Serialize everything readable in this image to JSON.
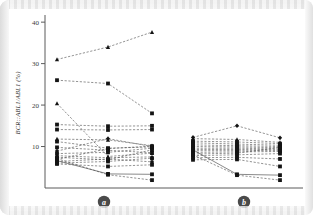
{
  "figure": {
    "name": "bcr-abl1-spaghetti-plot",
    "background": "#ffffff",
    "line_color": "#4a4a4a",
    "marker_color": "#141414",
    "axis_color": "#5b5b5b"
  },
  "axis": {
    "y_label": "BCR::ABL1/ABL1 (%)",
    "y_ticks": [
      10,
      20,
      30,
      40
    ],
    "y_tick_labels": [
      "10",
      "20",
      "30",
      "40"
    ],
    "y_min": 0,
    "y_max": 41
  },
  "groups": [
    {
      "id": "a",
      "label": "a"
    },
    {
      "id": "b",
      "label": "b"
    }
  ],
  "chart_data": {
    "type": "line",
    "title": "",
    "xlabel": "",
    "ylabel": "BCR::ABL1/ABL1 (%)",
    "ylim": [
      0,
      41
    ],
    "grid": false,
    "legend": "none",
    "x_tick_labels": [
      "a",
      "b"
    ],
    "panels": [
      {
        "name": "a",
        "x_positions": [
          1,
          2,
          3
        ],
        "series": [
          {
            "name": "a1",
            "marker": "triangle",
            "style": "dashed",
            "values": [
              31.0,
              34.0,
              37.6
            ]
          },
          {
            "name": "a2",
            "marker": "square",
            "style": "dashed",
            "values": [
              26.0,
              25.2,
              18.0
            ]
          },
          {
            "name": "a3",
            "marker": "triangle",
            "style": "dashed",
            "values": [
              20.4,
              7.6,
              8.4
            ]
          },
          {
            "name": "a4",
            "marker": "square",
            "style": "dashed",
            "values": [
              15.3,
              14.9,
              15.0
            ]
          },
          {
            "name": "a5",
            "marker": "square",
            "style": "dashed",
            "values": [
              14.1,
              14.0,
              14.1
            ]
          },
          {
            "name": "a6",
            "marker": "triangle",
            "style": "dashed",
            "values": [
              11.8,
              11.6,
              10.2
            ]
          },
          {
            "name": "a7",
            "marker": "square",
            "style": "dashed",
            "values": [
              11.2,
              9.6,
              9.9
            ]
          },
          {
            "name": "a8",
            "marker": "square",
            "style": "dashed",
            "values": [
              9.8,
              9.1,
              8.5
            ]
          },
          {
            "name": "a9",
            "marker": "diamond",
            "style": "dashed",
            "values": [
              8.9,
              11.9,
              10.0
            ]
          },
          {
            "name": "a10",
            "marker": "square",
            "style": "dashed",
            "values": [
              8.3,
              8.6,
              9.6
            ]
          },
          {
            "name": "a11",
            "marker": "triangle",
            "style": "dashed",
            "values": [
              7.8,
              7.3,
              7.5
            ]
          },
          {
            "name": "a12",
            "marker": "square",
            "style": "dashed",
            "values": [
              7.4,
              6.8,
              9.2
            ]
          },
          {
            "name": "a13",
            "marker": "square",
            "style": "dashed",
            "values": [
              6.9,
              9.5,
              10.1
            ]
          },
          {
            "name": "a14",
            "marker": "circle",
            "style": "dashed",
            "values": [
              6.4,
              7.0,
              6.3
            ]
          },
          {
            "name": "a15",
            "marker": "square",
            "style": "dashed",
            "values": [
              6.0,
              6.4,
              7.2
            ]
          },
          {
            "name": "a16",
            "marker": "square",
            "style": "dashed",
            "values": [
              5.8,
              5.2,
              5.6
            ]
          },
          {
            "name": "a17",
            "marker": "square",
            "style": "solid",
            "values": [
              6.6,
              3.4,
              3.3
            ]
          },
          {
            "name": "a18",
            "marker": "square",
            "style": "dashed",
            "values": [
              7.1,
              3.2,
              1.9
            ]
          }
        ]
      },
      {
        "name": "b",
        "x_positions": [
          1,
          2,
          3
        ],
        "series": [
          {
            "name": "b1",
            "marker": "diamond",
            "style": "dashed",
            "values": [
              12.2,
              15.0,
              12.1
            ]
          },
          {
            "name": "b2",
            "marker": "triangle",
            "style": "dashed",
            "values": [
              11.9,
              11.7,
              11.0
            ]
          },
          {
            "name": "b3",
            "marker": "square",
            "style": "dashed",
            "values": [
              11.3,
              11.1,
              10.7
            ]
          },
          {
            "name": "b4",
            "marker": "square",
            "style": "dashed",
            "values": [
              10.9,
              10.6,
              10.3
            ]
          },
          {
            "name": "b5",
            "marker": "square",
            "style": "dashed",
            "values": [
              10.4,
              10.2,
              10.0
            ]
          },
          {
            "name": "b6",
            "marker": "square",
            "style": "dashed",
            "values": [
              10.0,
              9.9,
              9.7
            ]
          },
          {
            "name": "b7",
            "marker": "square",
            "style": "dashed",
            "values": [
              9.6,
              9.6,
              9.4
            ]
          },
          {
            "name": "b8",
            "marker": "square",
            "style": "dashed",
            "values": [
              9.3,
              9.3,
              9.2
            ]
          },
          {
            "name": "b9",
            "marker": "square",
            "style": "dashed",
            "values": [
              9.0,
              9.0,
              9.0
            ]
          },
          {
            "name": "b10",
            "marker": "square",
            "style": "dashed",
            "values": [
              8.6,
              8.7,
              8.8
            ]
          },
          {
            "name": "b11",
            "marker": "square",
            "style": "dashed",
            "values": [
              8.2,
              8.4,
              9.8
            ]
          },
          {
            "name": "b12",
            "marker": "square",
            "style": "dashed",
            "values": [
              7.8,
              8.0,
              8.3
            ]
          },
          {
            "name": "b13",
            "marker": "square",
            "style": "dashed",
            "values": [
              7.3,
              7.4,
              7.0
            ]
          },
          {
            "name": "b14",
            "marker": "square",
            "style": "dashed",
            "values": [
              6.8,
              6.9,
              5.2
            ]
          },
          {
            "name": "b15",
            "marker": "square",
            "style": "solid",
            "values": [
              9.2,
              3.3,
              3.1
            ]
          },
          {
            "name": "b16",
            "marker": "square",
            "style": "dashed",
            "values": [
              8.0,
              3.1,
              1.9
            ]
          }
        ]
      }
    ]
  }
}
